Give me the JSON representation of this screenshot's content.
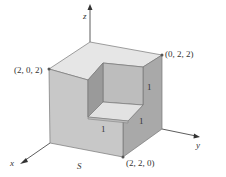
{
  "figure": {
    "type": "3d-solid-diagram"
  },
  "axes": {
    "x": "x",
    "y": "y",
    "z": "z"
  },
  "points": {
    "p1": "(2, 0, 2)",
    "p2": "(0, 2, 2)",
    "p3": "(2, 2, 0)"
  },
  "edge_labels": {
    "notch_vertical": "1",
    "notch_floor_front": "1",
    "notch_floor_right": "1"
  },
  "surface_label": "S",
  "colors": {
    "top_face": "#e6e6e6",
    "front_face": "#c8c8c8",
    "right_face": "#a9a9a9",
    "notch_back": "#bdbdbd",
    "notch_side": "#9a9a9a",
    "notch_floor": "#e2e2e2",
    "edge": "#777777"
  }
}
